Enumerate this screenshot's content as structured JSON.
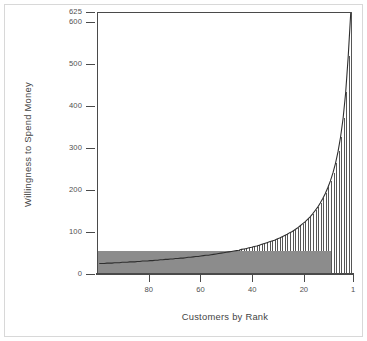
{
  "figure": {
    "frame_color": "#d8d8d8",
    "background": "#ffffff",
    "axis_color": "#4a4a4a"
  },
  "chart_data": {
    "type": "bar",
    "title": "",
    "subtitle": "",
    "xlabel": "Customers by Rank",
    "ylabel": "Willingness to Spend Money",
    "xlim": [
      100,
      1
    ],
    "ylim": [
      0,
      625
    ],
    "x_axis_reversed": true,
    "grid": false,
    "legend_position": "none",
    "yticks": [
      0,
      100,
      200,
      300,
      400,
      500,
      600,
      625
    ],
    "ytick_labels": [
      "0",
      "100",
      "200",
      "300",
      "400",
      "500",
      "600",
      "625"
    ],
    "xticks": [
      80,
      60,
      40,
      20,
      1
    ],
    "xtick_labels": [
      "80",
      "60",
      "40",
      "20",
      "1"
    ],
    "series_name": "Willingness to spend",
    "bar_count": 100,
    "bar_fill": "#ffffff",
    "bar_edge": "#565656",
    "x": [
      100,
      99,
      98,
      97,
      96,
      95,
      94,
      93,
      92,
      91,
      90,
      89,
      88,
      87,
      86,
      85,
      84,
      83,
      82,
      81,
      80,
      79,
      78,
      77,
      76,
      75,
      74,
      73,
      72,
      71,
      70,
      69,
      68,
      67,
      66,
      65,
      64,
      63,
      62,
      61,
      60,
      59,
      58,
      57,
      56,
      55,
      54,
      53,
      52,
      51,
      50,
      49,
      48,
      47,
      46,
      45,
      44,
      43,
      42,
      41,
      40,
      39,
      38,
      37,
      36,
      35,
      34,
      33,
      32,
      31,
      30,
      29,
      28,
      27,
      26,
      25,
      24,
      23,
      22,
      21,
      20,
      19,
      18,
      17,
      16,
      15,
      14,
      13,
      12,
      11,
      10,
      9,
      8,
      7,
      6,
      5,
      4,
      3,
      2,
      1
    ],
    "values": [
      25,
      25,
      25,
      26,
      26,
      26,
      27,
      27,
      27,
      28,
      28,
      28,
      29,
      29,
      29,
      30,
      30,
      31,
      31,
      31,
      32,
      32,
      33,
      33,
      34,
      34,
      35,
      35,
      36,
      36,
      37,
      37,
      38,
      38,
      39,
      40,
      40,
      41,
      42,
      42,
      43,
      44,
      45,
      45,
      46,
      47,
      48,
      49,
      50,
      51,
      52,
      53,
      54,
      55,
      56,
      57,
      59,
      60,
      61,
      63,
      64,
      66,
      67,
      69,
      71,
      73,
      75,
      77,
      79,
      81,
      84,
      86,
      89,
      92,
      95,
      99,
      102,
      106,
      110,
      115,
      120,
      125,
      131,
      137,
      144,
      152,
      160,
      170,
      181,
      193,
      207,
      223,
      242,
      265,
      293,
      328,
      373,
      434,
      520,
      625
    ],
    "annotations": [
      {
        "name": "light-gray-block",
        "description": "Light gray rectangle spanning top customers (rank 10 to 1) up to about 205",
        "x_from": 10,
        "x_to": 1,
        "y_top": 205,
        "color": "#b6b6b6"
      },
      {
        "name": "dark-gray-block",
        "description": "Darker gray rectangle spanning remaining customers (rank 100 to 10) up to about 55",
        "x_from": 100,
        "x_to": 10,
        "y_top": 55,
        "color": "#8c8c8c"
      }
    ]
  }
}
